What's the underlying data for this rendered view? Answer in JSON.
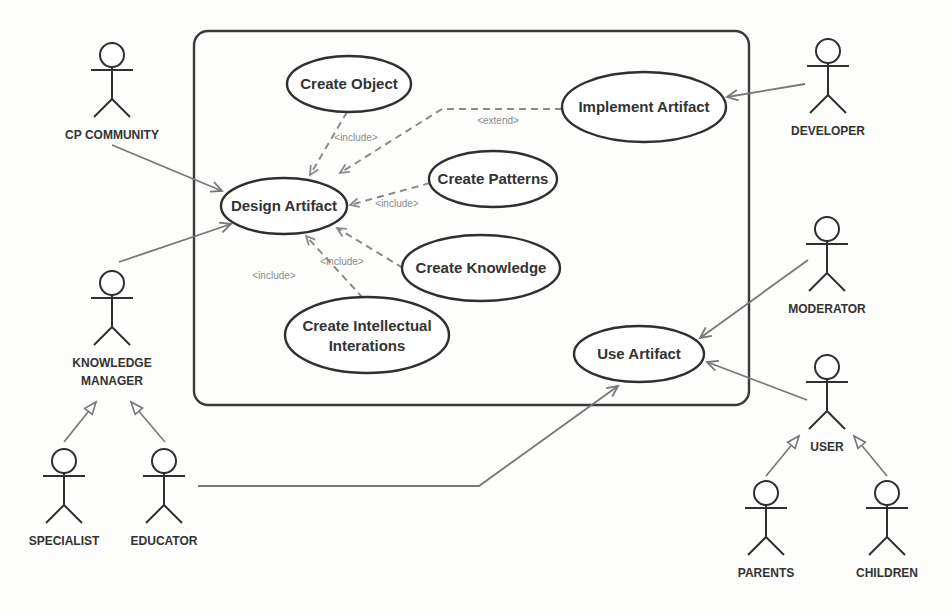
{
  "diagram": {
    "type": "uml-use-case",
    "colors": {
      "outline": "#2f2f2f",
      "association": "#777777",
      "dependency": "#8a8a8a",
      "text": "#333333",
      "background": "#fdfdfb"
    },
    "system_boundary": {
      "x": 194,
      "y": 31,
      "w": 555,
      "h": 374,
      "r": 14
    },
    "use_cases": [
      {
        "id": "create_object",
        "label": "Create Object",
        "cx": 349,
        "cy": 84,
        "rx": 62,
        "ry": 28
      },
      {
        "id": "implement_artifact",
        "label": "Implement Artifact",
        "cx": 644,
        "cy": 107,
        "rx": 82,
        "ry": 35
      },
      {
        "id": "design_artifact",
        "label": "Design Artifact",
        "cx": 284,
        "cy": 206,
        "rx": 63,
        "ry": 28
      },
      {
        "id": "create_patterns",
        "label": "Create Patterns",
        "cx": 493,
        "cy": 179,
        "rx": 64,
        "ry": 28
      },
      {
        "id": "create_knowledge",
        "label": "Create Knowledge",
        "cx": 481,
        "cy": 268,
        "rx": 79,
        "ry": 33
      },
      {
        "id": "create_intellectual_interactions",
        "label_line1": "Create Intellectual",
        "label_line2": "Interations",
        "cx": 367,
        "cy": 335,
        "rx": 82,
        "ry": 38
      },
      {
        "id": "use_artifact",
        "label": "Use Artifact",
        "cx": 639,
        "cy": 354,
        "rx": 65,
        "ry": 28
      }
    ],
    "actors": [
      {
        "id": "cp_community",
        "label": "CP COMMUNITY",
        "x": 112,
        "y": 42
      },
      {
        "id": "developer",
        "label": "DEVELOPER",
        "x": 828,
        "y": 38
      },
      {
        "id": "knowledge_manager",
        "label_line1": "KNOWLEDGE",
        "label_line2": "MANAGER",
        "x": 112,
        "y": 270
      },
      {
        "id": "moderator",
        "label": "MODERATOR",
        "x": 827,
        "y": 216
      },
      {
        "id": "user",
        "label": "USER",
        "x": 827,
        "y": 354
      },
      {
        "id": "specialist",
        "label": "SPECIALIST",
        "x": 64,
        "y": 448
      },
      {
        "id": "educator",
        "label": "EDUCATOR",
        "x": 164,
        "y": 448
      },
      {
        "id": "parents",
        "label": "PARENTS",
        "x": 766,
        "y": 480
      },
      {
        "id": "children",
        "label": "CHILDREN",
        "x": 887,
        "y": 480
      }
    ],
    "associations": [
      {
        "from": "cp_community",
        "to": "design_artifact",
        "points": "112,145 222,191"
      },
      {
        "from": "knowledge_manager",
        "to": "design_artifact",
        "points": "119,262 231,224"
      },
      {
        "from": "developer",
        "to": "implement_artifact",
        "points": "805,84 727,97"
      },
      {
        "from": "moderator",
        "to": "use_artifact",
        "points": "808,260 700,338"
      },
      {
        "from": "user",
        "to": "use_artifact",
        "points": "807,400 707,362"
      },
      {
        "from": "educator",
        "to": "use_artifact",
        "points": "198,486 479,486 618,386"
      }
    ],
    "dependencies": [
      {
        "kind": "include",
        "label": "<include>",
        "points": "347,112 310,175",
        "lx": 356,
        "ly": 141
      },
      {
        "kind": "extend",
        "label": "<extend>",
        "points": "562,109 442,109 340,173",
        "lx": 498,
        "ly": 124
      },
      {
        "kind": "include",
        "label": "<include>",
        "points": "430,183 350,205",
        "lx": 397,
        "ly": 207
      },
      {
        "kind": "include",
        "label": "<include>",
        "points": "403,268 337,228",
        "lx": 342,
        "ly": 265
      },
      {
        "kind": "include",
        "label": "<include>",
        "points": "363,298 306,236",
        "lx": 274,
        "ly": 279
      }
    ],
    "generalizations": [
      {
        "child": "specialist",
        "parent": "knowledge_manager",
        "points": "64,442 96,402"
      },
      {
        "child": "educator",
        "parent": "knowledge_manager",
        "points": "165,442 131,402"
      },
      {
        "child": "parents",
        "parent": "user",
        "points": "766,476 799,436"
      },
      {
        "child": "children",
        "parent": "user",
        "points": "887,476 854,436"
      }
    ]
  }
}
